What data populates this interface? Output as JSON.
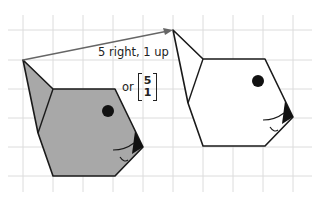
{
  "diagram": {
    "type": "translation",
    "description_text": "5 right, 1 up",
    "or_text": "or",
    "vector": {
      "top": "5",
      "bottom": "1"
    },
    "grid": {
      "color": "#d8d8d8",
      "spacing_px": 30
    },
    "object": {
      "fill_color": "#a8a8a8",
      "outline_color": "#1a1a1a"
    },
    "image": {
      "fill_color": "#ffffff",
      "outline_color": "#1a1a1a"
    },
    "arrow_color": "#666666"
  }
}
